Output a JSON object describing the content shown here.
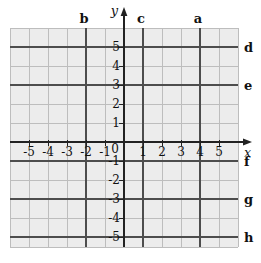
{
  "chart_data": {
    "type": "line",
    "title": "",
    "description_visible_labels": [
      "b",
      "y",
      "c",
      "a",
      "d",
      "e",
      "x",
      "f",
      "g",
      "h"
    ],
    "x_axis": {
      "label": "x",
      "range": [
        -6,
        6
      ],
      "tick_values": [
        -5,
        -4,
        -3,
        -2,
        -1,
        1,
        2,
        3,
        4,
        5
      ]
    },
    "y_axis": {
      "label": "y",
      "range": [
        -6,
        6
      ],
      "tick_values": [
        5,
        4,
        3,
        2,
        1,
        -1,
        -2,
        -3,
        -4,
        -5
      ]
    },
    "origin_label": "0",
    "grid": true,
    "lines": [
      {
        "label": "b",
        "orientation": "vertical",
        "x": -2
      },
      {
        "label": "c",
        "orientation": "vertical",
        "x": 1
      },
      {
        "label": "a",
        "orientation": "vertical",
        "x": 4
      },
      {
        "label": "d",
        "orientation": "horizontal",
        "y": 5
      },
      {
        "label": "e",
        "orientation": "horizontal",
        "y": 3
      },
      {
        "label": "f",
        "orientation": "horizontal",
        "y": -1
      },
      {
        "label": "g",
        "orientation": "horizontal",
        "y": -3
      },
      {
        "label": "h",
        "orientation": "horizontal",
        "y": -5
      }
    ],
    "colors": {
      "background": "#ffffff",
      "grid_background": "#ececec",
      "grid_line": "#bdbdbd",
      "labeled_line": "#4d4d4d",
      "axis": "#222222",
      "text": "#111111"
    }
  }
}
